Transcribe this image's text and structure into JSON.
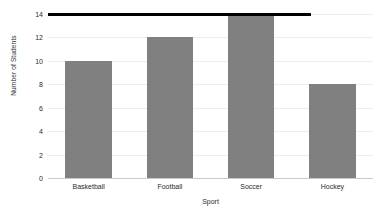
{
  "chart_data": {
    "type": "bar",
    "title": "",
    "categories": [
      "Basketball",
      "Football",
      "Soccer",
      "Hockey"
    ],
    "values": [
      10,
      12,
      14,
      8
    ],
    "series": [
      {
        "name": "Number of Students",
        "values": [
          10,
          12,
          14,
          8
        ]
      }
    ],
    "xlabel": "Sport",
    "ylabel": "Number of Students",
    "ylim": [
      0,
      14
    ],
    "ytick_labels": [
      "0",
      "2",
      "4",
      "6",
      "8",
      "10",
      "12",
      "14"
    ],
    "ytick_values": [
      0,
      2,
      4,
      6,
      8,
      10,
      12,
      14
    ],
    "grid": true,
    "legend": "none",
    "bar_color": "#808080",
    "gridline_color": "#ededed",
    "axis_color": "#c9c9c9",
    "annotations": [
      {
        "type": "reference-line",
        "orientation": "horizontal",
        "value": 14,
        "color": "#000000",
        "label": "",
        "x_start_category_index": 0,
        "x_end_fraction": 0.81
      }
    ]
  }
}
